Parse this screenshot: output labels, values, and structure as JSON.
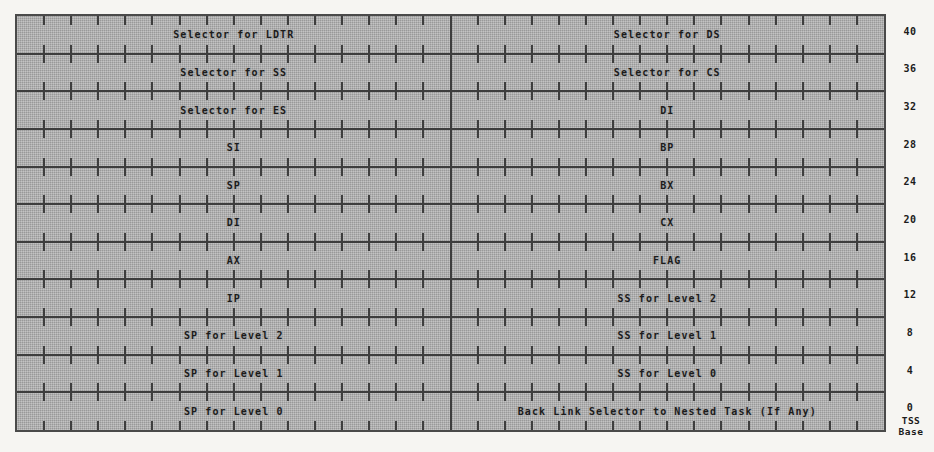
{
  "figure": {
    "word_width_bits": 16,
    "columns": 2,
    "rows": 11,
    "colors": {
      "page_background": "#f6f5f2",
      "field_fill": "#aaaaaa",
      "rule": "#3e3e3e",
      "text": "#1b1b1b"
    }
  },
  "grid": {
    "bits_per_half": 16,
    "tick_overhang_px": 9
  },
  "rows": [
    {
      "offset": "40",
      "left": "Selector for LDTR",
      "right": "Selector for DS"
    },
    {
      "offset": "36",
      "left": "Selector for SS",
      "right": "Selector for CS"
    },
    {
      "offset": "32",
      "left": "Selector for ES",
      "right": "DI"
    },
    {
      "offset": "28",
      "left": "SI",
      "right": "BP"
    },
    {
      "offset": "24",
      "left": "SP",
      "right": "BX"
    },
    {
      "offset": "20",
      "left": "DI",
      "right": "CX"
    },
    {
      "offset": "16",
      "left": "AX",
      "right": "FLAG"
    },
    {
      "offset": "12",
      "left": "IP",
      "right": "SS for Level 2"
    },
    {
      "offset": "8",
      "left": "SP for Level 2",
      "right": "SS for Level 1"
    },
    {
      "offset": "4",
      "left": "SP for Level 1",
      "right": "SS for Level 0"
    },
    {
      "offset": "0",
      "left": "SP for Level 0",
      "right": "Back Link Selector to Nested Task (If Any)"
    }
  ],
  "base_annotation": {
    "line1": "TSS",
    "line2": "Base"
  }
}
